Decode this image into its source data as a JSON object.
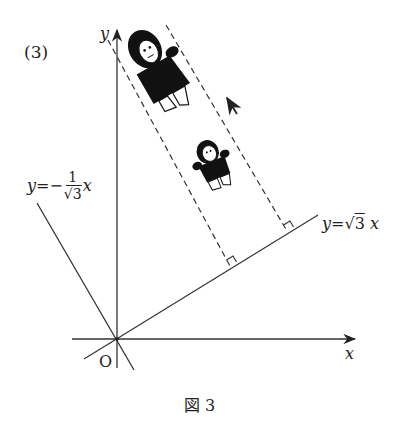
{
  "figure": {
    "problem_number": "(3)",
    "caption": "図 3",
    "axes": {
      "x_label": "x",
      "y_label": "y",
      "origin_label": "O"
    },
    "lines": [
      {
        "name": "line-sqrt3",
        "equation_lhs": "y=",
        "equation_rhs_root": "3",
        "equation_var": "x",
        "slope": "√3"
      },
      {
        "name": "line-neg-inv-sqrt3",
        "equation_lhs": "y=−",
        "frac_num": "1",
        "frac_den_root": "3",
        "equation_var": "x",
        "slope": "−1/√3"
      }
    ],
    "annotations": {
      "direction_arrow": "up-left arrow",
      "characters": [
        "large running figure",
        "small running figure"
      ],
      "right_angle_marks": 2,
      "dashed_guides": 2
    },
    "colors": {
      "ink": "#222222",
      "background": "#ffffff"
    }
  }
}
